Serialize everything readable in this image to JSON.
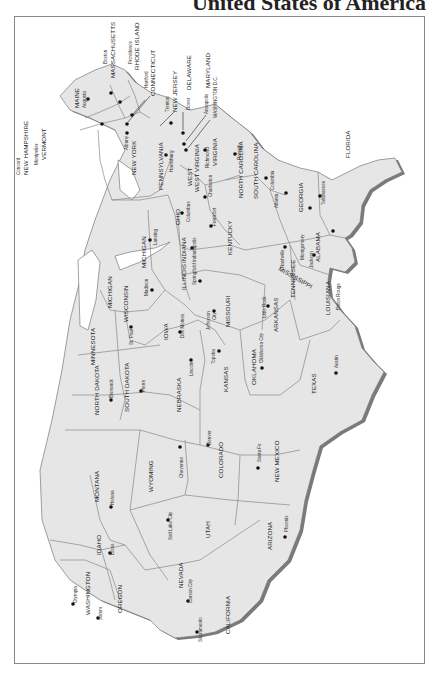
{
  "title": "United States of America",
  "map": {
    "orientation": "rotated 90 degrees clockwise (north to the right)",
    "colors": {
      "land": "#e6e6e6",
      "shadow": "#7a7a7a",
      "border": "#777777",
      "frame": "#888888",
      "text": "#222222"
    },
    "states": [
      {
        "name": "MAINE",
        "capital": "Augusta"
      },
      {
        "name": "NEW HAMPSHIRE",
        "capital": "Concord"
      },
      {
        "name": "VERMONT",
        "capital": "Montpelier"
      },
      {
        "name": "MASSACHUSETTS",
        "capital": "Boston"
      },
      {
        "name": "RHODE ISLAND",
        "capital": "Providence"
      },
      {
        "name": "CONNECTICUT",
        "capital": "Hartford"
      },
      {
        "name": "NEW YORK",
        "capital": "Albany"
      },
      {
        "name": "NEW JERSEY",
        "capital": "Trenton"
      },
      {
        "name": "DELAWARE",
        "capital": "Dover"
      },
      {
        "name": "MARYLAND",
        "capital": "Annapolis"
      },
      {
        "name": "WASHINGTON D.C.",
        "capital": ""
      },
      {
        "name": "PENNSYLVANIA",
        "capital": "Harrisburg"
      },
      {
        "name": "WEST VIRGINIA",
        "capital": "Charleston"
      },
      {
        "name": "VIRGINIA",
        "capital": "Richmond"
      },
      {
        "name": "NORTH CAROLINA",
        "capital": "Raleigh"
      },
      {
        "name": "SOUTH CAROLINA",
        "capital": "Columbia"
      },
      {
        "name": "GEORGIA",
        "capital": "Atlanta"
      },
      {
        "name": "FLORIDA",
        "capital": "Tallahassee"
      },
      {
        "name": "ALABAMA",
        "capital": "Montgomery"
      },
      {
        "name": "MISSISSIPPI",
        "capital": "Jackson"
      },
      {
        "name": "TENNESSEE",
        "capital": "Nashville"
      },
      {
        "name": "KENTUCKY",
        "capital": "Frankfort"
      },
      {
        "name": "OHIO",
        "capital": "Columbus"
      },
      {
        "name": "MICHIGAN",
        "capital": "Lansing"
      },
      {
        "name": "INDIANA",
        "capital": "Indianapolis"
      },
      {
        "name": "ILLINOIS",
        "capital": "Springfield"
      },
      {
        "name": "WISCONSIN",
        "capital": "Madison"
      },
      {
        "name": "MINNESOTA",
        "capital": "St. Paul"
      },
      {
        "name": "IOWA",
        "capital": "Des Moines"
      },
      {
        "name": "MISSOURI",
        "capital": "Jefferson City"
      },
      {
        "name": "ARKANSAS",
        "capital": "Little Rock"
      },
      {
        "name": "LOUISIANA",
        "capital": "Baton Rouge"
      },
      {
        "name": "TEXAS",
        "capital": "Austin"
      },
      {
        "name": "OKLAHOMA",
        "capital": "Oklahoma City"
      },
      {
        "name": "KANSAS",
        "capital": "Topeka"
      },
      {
        "name": "NEBRASKA",
        "capital": "Lincoln"
      },
      {
        "name": "SOUTH DAKOTA",
        "capital": "Pierre"
      },
      {
        "name": "NORTH DAKOTA",
        "capital": "Bismarck"
      },
      {
        "name": "MONTANA",
        "capital": "Helena"
      },
      {
        "name": "WYOMING",
        "capital": "Cheyenne"
      },
      {
        "name": "COLORADO",
        "capital": "Denver"
      },
      {
        "name": "NEW MEXICO",
        "capital": "Santa Fe"
      },
      {
        "name": "ARIZONA",
        "capital": "Phoenix"
      },
      {
        "name": "UTAH",
        "capital": "Salt Lake City"
      },
      {
        "name": "NEVADA",
        "capital": "Carson City"
      },
      {
        "name": "IDAHO",
        "capital": "Boise"
      },
      {
        "name": "WASHINGTON",
        "capital": "Olympia"
      },
      {
        "name": "OREGON",
        "capital": "Salem"
      },
      {
        "name": "CALIFORNIA",
        "capital": "Sacramento"
      }
    ]
  }
}
